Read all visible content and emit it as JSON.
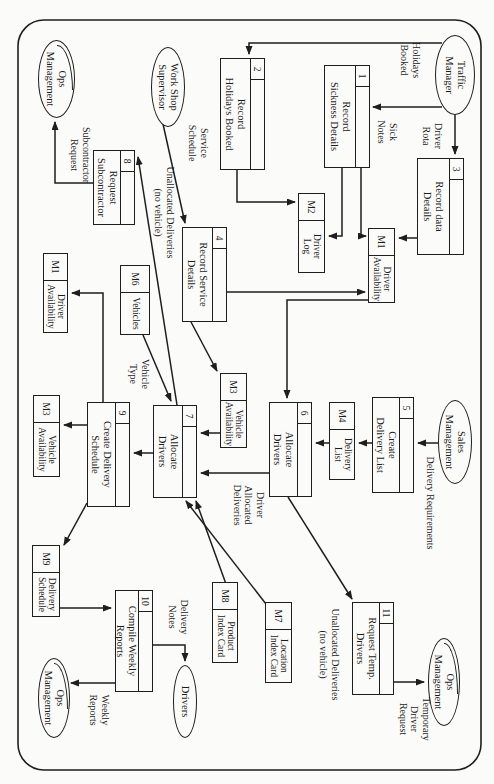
{
  "diagram": {
    "type": "data-flow-diagram",
    "ink_color": "#1e1e1e",
    "paper_color": "#fbfbf9",
    "processes": [
      {
        "key": "p1",
        "num": "1",
        "title": "Record\nSickness Details"
      },
      {
        "key": "p2",
        "num": "2",
        "title": "Record\nHolidays Booked"
      },
      {
        "key": "p3",
        "num": "3",
        "title": "Record data\nDetails"
      },
      {
        "key": "p4",
        "num": "4",
        "title": "Record Service\nDetails"
      },
      {
        "key": "p5",
        "num": "5",
        "title": "Create\nDelivery List"
      },
      {
        "key": "p6",
        "num": "6",
        "title": "Allocate\nDrivers"
      },
      {
        "key": "p7",
        "num": "7",
        "title": "Allocate\nDrivers"
      },
      {
        "key": "p8",
        "num": "8",
        "title": "Request\nSubcontractor"
      },
      {
        "key": "p9",
        "num": "9",
        "title": "Create Delivery\nSchedule"
      },
      {
        "key": "p10",
        "num": "10",
        "title": "Compile Weekly\nReports"
      },
      {
        "key": "p11",
        "num": "11",
        "title": "Request Temp.\nDrivers"
      }
    ],
    "stores": [
      {
        "key": "m1",
        "code": "M1",
        "name": "Driver\nAvailability"
      },
      {
        "key": "m2",
        "code": "M2",
        "name": "Driver\nLog"
      },
      {
        "key": "m1b",
        "code": "M1",
        "name": "Driver\nAvailability"
      },
      {
        "key": "m3a",
        "code": "M3",
        "name": "Vehicle\nAvailability"
      },
      {
        "key": "m3b",
        "code": "M3",
        "name": "Vehicle\nAvailability"
      },
      {
        "key": "m4",
        "code": "M4",
        "name": "Delivery\nList"
      },
      {
        "key": "m6",
        "code": "M6",
        "name": "Vehicles"
      },
      {
        "key": "m7",
        "code": "M7",
        "name": "Location\nIndex Card"
      },
      {
        "key": "m8",
        "code": "M8",
        "name": "Product\nIndex Card"
      },
      {
        "key": "m9",
        "code": "M9",
        "name": "Delivery\nSchedule"
      }
    ],
    "entities": [
      {
        "key": "traffic",
        "name": "Traffic\nManager",
        "dup": false
      },
      {
        "key": "wss",
        "name": "Work Shop\nSupervisor",
        "dup": false
      },
      {
        "key": "sales",
        "name": "Sales\nManagement",
        "dup": false
      },
      {
        "key": "ops1",
        "name": "Ops\nManagement",
        "dup": true
      },
      {
        "key": "ops2",
        "name": "Ops\nManagement",
        "dup": true
      },
      {
        "key": "ops3",
        "name": "Ops\nManagement",
        "dup": true
      },
      {
        "key": "drivers",
        "name": "Drivers",
        "dup": false
      }
    ],
    "flow_labels": [
      {
        "key": "holidays",
        "text": "Holidays\nBooked"
      },
      {
        "key": "sick",
        "text": "Sick\nNotes"
      },
      {
        "key": "rota",
        "text": "Driver\nRota"
      },
      {
        "key": "service",
        "text": "Service\nSchedule"
      },
      {
        "key": "unalloc1",
        "text": "Unallocated Deliveries\n(no vehicle)"
      },
      {
        "key": "subreq",
        "text": "Subcontractor\nRequest"
      },
      {
        "key": "vtype",
        "text": "Vehicle\nType"
      },
      {
        "key": "delreq",
        "text": "Delivery Requirements"
      },
      {
        "key": "drivalloc",
        "text": "Driver\nAllocated\nDeliveries"
      },
      {
        "key": "unalloc2",
        "text": "Unallocated Deliveries\n(no vehicle)"
      },
      {
        "key": "tempreq",
        "text": "Temporary\nDriver\nRequest"
      },
      {
        "key": "delnotes",
        "text": "Delivery\nNotes"
      },
      {
        "key": "weekly",
        "text": "Weekly\nReports"
      }
    ]
  }
}
